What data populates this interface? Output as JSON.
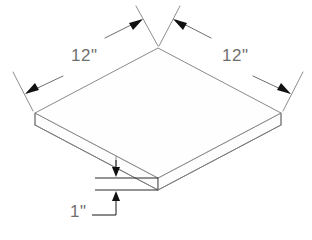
{
  "drawing": {
    "title": "Isometric square slab with dimensions",
    "background_color": "#ffffff",
    "line_color": "#7b7b7b",
    "dim_line_color": "#2a2a2a",
    "text_color": "#6f6f6f",
    "units": "inches"
  },
  "dimensions": {
    "left_edge": {
      "label": "12\"",
      "value": 12,
      "unit": "in",
      "name": "left side length"
    },
    "right_edge": {
      "label": "12\"",
      "value": 12,
      "unit": "in",
      "name": "right side length"
    },
    "thickness": {
      "label": "1\"",
      "value": 1,
      "unit": "in",
      "name": "slab thickness"
    }
  },
  "geometry": {
    "shape": "rectangular slab",
    "projection": "isometric",
    "top_face": {
      "top_vertex": [
        158,
        48
      ],
      "left_vertex": [
        35,
        113
      ],
      "front_vertex": [
        158,
        178
      ],
      "right_vertex": [
        281,
        113
      ]
    },
    "thickness_offset_px": 12
  },
  "annotations": {
    "left_dimension_text": "12\"",
    "right_dimension_text": "12\"",
    "thickness_dimension_text": "1\""
  }
}
